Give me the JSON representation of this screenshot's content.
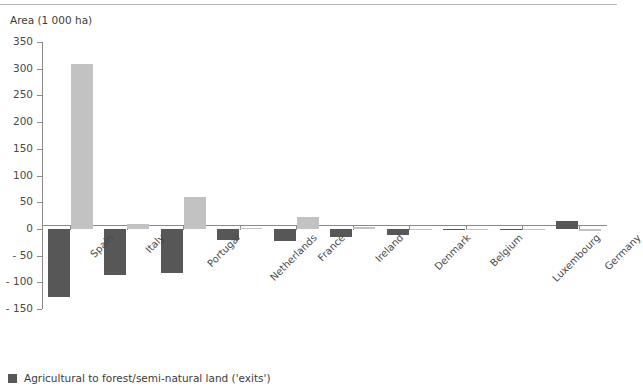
{
  "chart_data": {
    "type": "bar",
    "title": "",
    "subtitle": "",
    "ylabel": "Area (1 000 ha)",
    "xlabel": "",
    "ylim": [
      -150,
      350
    ],
    "yticks": [
      350,
      300,
      250,
      200,
      150,
      100,
      50,
      0,
      -50,
      -100,
      -150
    ],
    "ytick_labels": [
      "350",
      "300",
      "250",
      "200",
      "150",
      "100",
      "50",
      "0",
      "- 50",
      "- 100",
      "- 150"
    ],
    "grid": false,
    "legend_position": "bottom-left",
    "categories": [
      "Spain",
      "Italy",
      "Portugal",
      "Netherlands",
      "France",
      "Ireland",
      "Denmark",
      "Belgium",
      "Luxembourg",
      "Germany"
    ],
    "series": [
      {
        "name": "Agricultural to forest/semi-natural land ('exits')",
        "color": "#575757",
        "values": [
          -128,
          -87,
          -82,
          -20,
          -22,
          -15,
          -11,
          -2,
          -0.5,
          14
        ]
      },
      {
        "name": "Forest/semi-natural land to agricultural ('entries')",
        "color": "#c2c2c2",
        "values": [
          308,
          9,
          60,
          2,
          22,
          3,
          0.5,
          0.5,
          0.5,
          -4
        ]
      }
    ]
  },
  "legend": {
    "items": [
      {
        "label": "Agricultural to forest/semi-natural land ('exits')",
        "color": "#575757"
      }
    ]
  }
}
